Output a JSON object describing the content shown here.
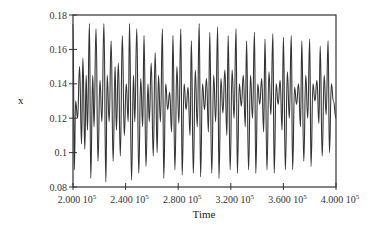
{
  "chart_data": {
    "type": "line",
    "title": "",
    "xlabel": "Time",
    "ylabel": "x",
    "xlim": [
      200000,
      400000
    ],
    "ylim": [
      0.08,
      0.18
    ],
    "grid": false,
    "legend": null,
    "x_ticks": [
      "2.000 10^5",
      "2.400 10^5",
      "2.800 10^5",
      "3.200 10^5",
      "3.600 10^5",
      "4.000 10^5"
    ],
    "y_ticks": [
      "0.08",
      "0.1",
      "0.12",
      "0.14",
      "0.16",
      "0.18"
    ],
    "series": [
      {
        "name": "x",
        "x": [
          200000,
          201000,
          202000,
          203500,
          205000,
          206500,
          207500,
          209000,
          210000,
          211000,
          212500,
          213500,
          215000,
          216000,
          217500,
          219000,
          220500,
          222000,
          223500,
          225000,
          226000,
          227500,
          229000,
          230500,
          232000,
          233000,
          234500,
          236000,
          237500,
          239000,
          240500,
          242000,
          243000,
          244500,
          246000,
          247000,
          248500,
          250000,
          251500,
          253000,
          254000,
          255500,
          257000,
          258000,
          259500,
          261000,
          262500,
          264000,
          265000,
          266500,
          268000,
          269000,
          270500,
          272000,
          273500,
          275000,
          276000,
          277500,
          279000,
          280500,
          282000,
          283000,
          284500,
          286000,
          287500,
          289000,
          290000,
          291500,
          293000,
          294500,
          296000,
          297000,
          298500,
          300000,
          301500,
          303000,
          304000,
          305500,
          307000,
          308500,
          310000,
          311000,
          312500,
          314000,
          315500,
          317000,
          318000,
          319500,
          321000,
          322500,
          324000,
          325000,
          326500,
          328000,
          329500,
          331000,
          332000,
          333500,
          335000,
          336500,
          338000,
          339000,
          340500,
          342000,
          343500,
          345000,
          346000,
          347500,
          349000,
          350500,
          352000,
          353000,
          354500,
          356000,
          357500,
          359000,
          360000,
          361500,
          363000,
          364500,
          366000,
          367000,
          368500,
          370000,
          371500,
          373000,
          374000,
          375500,
          377000,
          378500,
          380000,
          381000,
          382500,
          384000,
          385500,
          387000,
          388000,
          389500,
          391000,
          392500,
          394000,
          395000,
          396500,
          398000,
          400000
        ],
        "values": [
          0.175,
          0.09,
          0.13,
          0.12,
          0.15,
          0.105,
          0.155,
          0.102,
          0.145,
          0.113,
          0.175,
          0.085,
          0.145,
          0.115,
          0.172,
          0.095,
          0.142,
          0.118,
          0.175,
          0.083,
          0.145,
          0.118,
          0.165,
          0.095,
          0.15,
          0.113,
          0.152,
          0.098,
          0.168,
          0.11,
          0.14,
          0.118,
          0.175,
          0.084,
          0.145,
          0.118,
          0.172,
          0.088,
          0.143,
          0.115,
          0.168,
          0.092,
          0.14,
          0.118,
          0.152,
          0.098,
          0.158,
          0.1,
          0.145,
          0.118,
          0.172,
          0.085,
          0.14,
          0.125,
          0.135,
          0.112,
          0.168,
          0.09,
          0.15,
          0.117,
          0.172,
          0.087,
          0.14,
          0.125,
          0.138,
          0.11,
          0.165,
          0.088,
          0.148,
          0.115,
          0.175,
          0.086,
          0.14,
          0.125,
          0.143,
          0.112,
          0.17,
          0.088,
          0.145,
          0.118,
          0.173,
          0.085,
          0.143,
          0.123,
          0.148,
          0.11,
          0.168,
          0.09,
          0.148,
          0.12,
          0.172,
          0.088,
          0.14,
          0.127,
          0.145,
          0.115,
          0.165,
          0.09,
          0.145,
          0.12,
          0.17,
          0.088,
          0.14,
          0.128,
          0.143,
          0.112,
          0.166,
          0.09,
          0.147,
          0.122,
          0.169,
          0.088,
          0.14,
          0.128,
          0.142,
          0.113,
          0.167,
          0.09,
          0.147,
          0.12,
          0.168,
          0.09,
          0.138,
          0.128,
          0.14,
          0.115,
          0.165,
          0.095,
          0.145,
          0.12,
          0.166,
          0.092,
          0.14,
          0.13,
          0.142,
          0.117,
          0.162,
          0.098,
          0.145,
          0.122,
          0.165,
          0.1,
          0.14,
          0.13,
          0.12
        ]
      }
    ]
  }
}
